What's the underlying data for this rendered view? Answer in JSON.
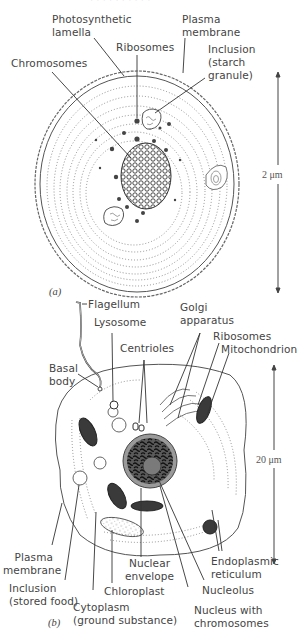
{
  "figure": {
    "top_cut_text": "· · ·  · ·  ·  · ·  ·  ·",
    "panel_a": {
      "tag": "(a)",
      "subject": "prokaryotic algal cell",
      "scale_bar": "2 μm",
      "labels": {
        "photosynthetic_lamella": [
          "Photosynthetic",
          "lamella"
        ],
        "plasma_membrane": [
          "Plasma",
          "membrane"
        ],
        "ribosomes": "Ribosomes",
        "inclusion": [
          "Inclusion",
          "(starch",
          "granule)"
        ],
        "chromosomes": "Chromosomes"
      }
    },
    "panel_b": {
      "tag": "(b)",
      "subject": "eukaryotic algal cell",
      "scale_bar": "20 μm",
      "labels": {
        "flagellum": "Flagellum",
        "lysosome": "Lysosome",
        "golgi": [
          "Golgi",
          "apparatus"
        ],
        "ribosomes": "Ribosomes",
        "mitochondrion": "Mitochondrion",
        "centrioles": "Centrioles",
        "basal_body": [
          "Basal",
          "body"
        ],
        "plasma_membrane": [
          "Plasma",
          "membrane"
        ],
        "inclusion": [
          "Inclusion",
          "(stored food)"
        ],
        "cytoplasm": [
          "Cytoplasm",
          "(ground substance)"
        ],
        "chloroplast": "Chloroplast",
        "nuclear_envelope": [
          "Nuclear",
          "envelope"
        ],
        "nucleus": [
          "Nucleus with",
          "chromosomes"
        ],
        "nucleolus": "Nucleolus",
        "er": [
          "Endoplasmic",
          "reticulum"
        ]
      }
    },
    "colors": {
      "ink": "#3a3a3a",
      "line": "#555555",
      "nucleus_fill": "#9a9a9a",
      "nucleus_dark": "#2e2e2e"
    }
  }
}
